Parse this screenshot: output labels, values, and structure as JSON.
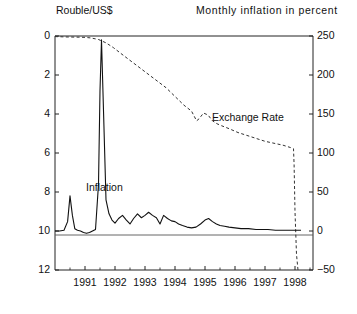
{
  "header": {
    "left_label": "Rouble/US$",
    "right_label": "Monthly inflation in percent"
  },
  "annotations": {
    "exchange_rate": "Exchange Rate",
    "inflation": "Inflation"
  },
  "axes": {
    "left_ticks": [
      "0",
      "2",
      "4",
      "6",
      "8",
      "10",
      "12"
    ],
    "right_ticks": [
      "250",
      "200",
      "150",
      "100",
      "50",
      "0",
      "-50"
    ],
    "x_ticks": [
      "1991",
      "1992",
      "1993",
      "1994",
      "1995",
      "1996",
      "1997",
      "1998"
    ]
  },
  "chart_data": {
    "type": "line",
    "title": "",
    "xlabel": "",
    "ylabel": "Rouble/US$",
    "y2label": "Monthly inflation in percent",
    "grid": false,
    "legend": "inline-annotations",
    "xlim": [
      1990.0,
      1998.6
    ],
    "ylim": [
      12,
      0
    ],
    "ylim_right": [
      -50,
      250
    ],
    "zero_reference_line_right": 0,
    "series": [
      {
        "name": "Exchange Rate",
        "axis": "left",
        "style": "dashed",
        "units": "Rouble/US$",
        "x": [
          1990.0,
          1990.4,
          1990.8,
          1991.0,
          1991.2,
          1991.45,
          1991.7,
          1991.95,
          1992.2,
          1992.5,
          1992.8,
          1993.1,
          1993.4,
          1993.7,
          1994.0,
          1994.3,
          1994.55,
          1994.72,
          1994.8,
          1994.95,
          1995.1,
          1995.25,
          1995.4,
          1995.55,
          1995.8,
          1996.1,
          1996.4,
          1996.7,
          1997.0,
          1997.3,
          1997.6,
          1997.85,
          1997.95,
          1997.97,
          1998.0,
          1998.05,
          1998.1
        ],
        "y": [
          0.03,
          0.05,
          0.06,
          0.07,
          0.1,
          0.18,
          0.35,
          0.6,
          0.9,
          1.25,
          1.6,
          1.95,
          2.3,
          2.65,
          3.1,
          3.55,
          3.85,
          4.35,
          4.25,
          3.95,
          4.05,
          4.35,
          4.5,
          4.6,
          4.75,
          4.95,
          5.1,
          5.25,
          5.4,
          5.5,
          5.6,
          5.72,
          5.78,
          6.6,
          9.0,
          11.2,
          12.0
        ]
      },
      {
        "name": "Inflation",
        "axis": "right",
        "style": "solid",
        "units": "percent per month",
        "x": [
          1990.0,
          1990.15,
          1990.3,
          1990.42,
          1990.5,
          1990.58,
          1990.66,
          1990.75,
          1990.85,
          1990.95,
          1991.05,
          1991.15,
          1991.25,
          1991.35,
          1991.45,
          1991.5,
          1991.55,
          1991.62,
          1991.7,
          1991.8,
          1991.9,
          1992.0,
          1992.12,
          1992.25,
          1992.38,
          1992.5,
          1992.62,
          1992.75,
          1992.88,
          1993.0,
          1993.12,
          1993.25,
          1993.38,
          1993.5,
          1993.62,
          1993.75,
          1993.88,
          1994.0,
          1994.12,
          1994.25,
          1994.4,
          1994.55,
          1994.7,
          1994.85,
          1995.0,
          1995.12,
          1995.25,
          1995.38,
          1995.5,
          1995.65,
          1995.8,
          1996.0,
          1996.2,
          1996.45,
          1996.7,
          1996.9,
          1997.1,
          1997.35,
          1997.6,
          1997.85,
          1998.05,
          1998.2
        ],
        "y": [
          0,
          0,
          1,
          12,
          45,
          20,
          3,
          1,
          0,
          -2,
          -3,
          -2,
          0,
          2,
          60,
          180,
          245,
          150,
          40,
          22,
          14,
          10,
          16,
          20,
          14,
          9,
          16,
          22,
          17,
          20,
          24,
          20,
          17,
          9,
          20,
          16,
          13,
          12,
          9,
          7,
          5,
          4,
          5,
          9,
          14,
          16,
          12,
          9,
          7,
          6,
          5,
          4,
          3,
          3,
          2,
          2,
          2,
          1,
          1,
          1,
          1,
          1
        ]
      }
    ]
  }
}
